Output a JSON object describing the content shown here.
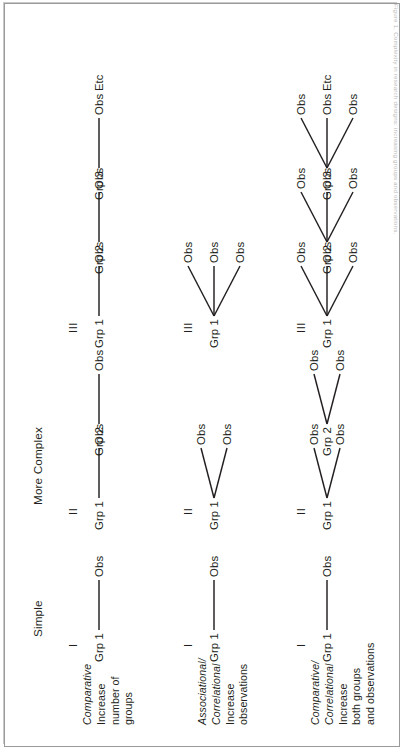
{
  "figure": {
    "column_headers": [
      "Simple",
      "More Complex"
    ],
    "column_numerals": [
      "I",
      "II",
      "III"
    ],
    "etc_label": "Etc",
    "group_prefix": "Grp",
    "observation_label": "Obs",
    "line_color": "#231f20",
    "text_color": "#231f20",
    "border_color": "#9a9a9a",
    "caption": "Figure 1. Complexity in research designs: increasing groups and observations."
  },
  "rows": [
    {
      "id": "row-comparative-groups",
      "label_italic": "Comparative",
      "label_lines": [
        "Increase",
        "number of",
        "groups"
      ],
      "columns": [
        {
          "numeral": "I",
          "groups": [
            {
              "name": "Grp 1",
              "observations": [
                "Obs"
              ]
            }
          ],
          "etc": false
        },
        {
          "numeral": "II",
          "groups": [
            {
              "name": "Grp 1",
              "observations": [
                "Obs"
              ]
            },
            {
              "name": "Grp 2",
              "observations": [
                "Obs"
              ]
            }
          ],
          "etc": false
        },
        {
          "numeral": "III",
          "groups": [
            {
              "name": "Grp 1",
              "observations": [
                "Obs"
              ]
            },
            {
              "name": "Grp 2",
              "observations": [
                "Obs"
              ]
            },
            {
              "name": "Grp 3",
              "observations": [
                "Obs"
              ]
            }
          ],
          "etc": true
        }
      ]
    },
    {
      "id": "row-associational-observations",
      "label_italic": "Associational/\nCorrelational",
      "label_lines": [
        "Increase",
        "observations"
      ],
      "columns": [
        {
          "numeral": "I",
          "groups": [
            {
              "name": "Grp 1",
              "observations": [
                "Obs"
              ]
            }
          ],
          "etc": false
        },
        {
          "numeral": "II",
          "groups": [
            {
              "name": "Grp 1",
              "observations": [
                "Obs",
                "Obs"
              ]
            }
          ],
          "etc": false
        },
        {
          "numeral": "III",
          "groups": [
            {
              "name": "Grp 1",
              "observations": [
                "Obs",
                "Obs",
                "Obs"
              ]
            }
          ],
          "etc": false
        }
      ]
    },
    {
      "id": "row-comparative-correlational-both",
      "label_italic": "Comparative/\nCorrelational",
      "label_lines": [
        "Increase",
        "both groups",
        "and observations"
      ],
      "columns": [
        {
          "numeral": "I",
          "groups": [
            {
              "name": "Grp 1",
              "observations": [
                "Obs"
              ]
            }
          ],
          "etc": false
        },
        {
          "numeral": "II",
          "groups": [
            {
              "name": "Grp 1",
              "observations": [
                "Obs",
                "Obs"
              ]
            },
            {
              "name": "Grp 2",
              "observations": [
                "Obs",
                "Obs"
              ]
            }
          ],
          "etc": false
        },
        {
          "numeral": "III",
          "groups": [
            {
              "name": "Grp 1",
              "observations": [
                "Obs",
                "Obs",
                "Obs"
              ]
            },
            {
              "name": "Grp 2",
              "observations": [
                "Obs",
                "Obs",
                "Obs"
              ]
            },
            {
              "name": "Grp 3",
              "observations": [
                "Obs",
                "Obs",
                "Obs"
              ]
            }
          ],
          "etc": true
        }
      ]
    }
  ]
}
